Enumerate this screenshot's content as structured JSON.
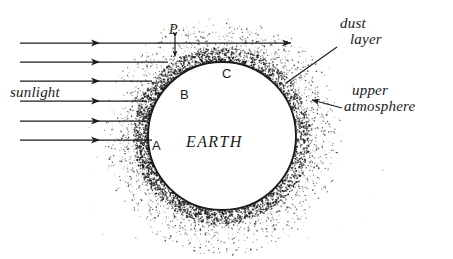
{
  "figure": {
    "background_color": "#ffffff",
    "ink_color": "#1c1c1c",
    "width": 453,
    "height": 259
  },
  "labels": {
    "sunlight": "sunlight",
    "earth": "EARTH",
    "dust_layer_line1": "dust",
    "dust_layer_line2": "layer",
    "upper_atmosphere_line1": "upper",
    "upper_atmosphere_line2": "atmosphere",
    "point_a": "A",
    "point_b": "B",
    "point_c": "C",
    "point_p": "P"
  },
  "geometry": {
    "earth": {
      "cx": 222,
      "cy": 136,
      "r": 74
    },
    "dust_band": {
      "inner_r": 74,
      "outer_r": 88
    },
    "halo": {
      "inner_r": 88,
      "outer_r": 116
    },
    "rays": [
      {
        "y": 43,
        "x1": 20,
        "x2": 291,
        "arrow_x": 100,
        "long": true
      },
      {
        "y": 62,
        "x1": 20,
        "x2": 168,
        "arrow_x": 100,
        "long": false
      },
      {
        "y": 81,
        "x1": 20,
        "x2": 152,
        "arrow_x": 100,
        "long": false
      },
      {
        "y": 101,
        "x1": 20,
        "x2": 147,
        "arrow_x": 100,
        "long": false
      },
      {
        "y": 121,
        "x1": 20,
        "x2": 148,
        "arrow_x": 100,
        "long": false
      },
      {
        "y": 140,
        "x1": 20,
        "x2": 152,
        "arrow_x": 100,
        "long": false
      }
    ],
    "p_marker": {
      "x": 175,
      "y_top": 37,
      "y_bottom": 56
    },
    "dust_leader": {
      "x1": 286,
      "y1": 83,
      "x2": 337,
      "y2": 47
    },
    "atmosphere_arrow": {
      "x1": 342,
      "y1": 108,
      "x2": 312,
      "y2": 100
    }
  },
  "label_positions": {
    "sunlight": {
      "x": 10,
      "y": 97
    },
    "earth": {
      "x": 186,
      "y": 147
    },
    "dust_layer": {
      "x": 340,
      "y": 28
    },
    "upper_atmosphere": {
      "x": 348,
      "y": 95
    },
    "point_a": {
      "x": 152,
      "y": 150
    },
    "point_b": {
      "x": 180,
      "y": 99
    },
    "point_c": {
      "x": 222,
      "y": 78
    },
    "point_p": {
      "x": 169,
      "y": 34
    }
  },
  "annotation_kinds": {
    "sunlight_rays": "horizontal-arrow-rays",
    "dust_layer_pointer": "leader-line",
    "upper_atmosphere_pointer": "arrow-left",
    "p_pointer": "double-headed-vertical-arrow"
  }
}
